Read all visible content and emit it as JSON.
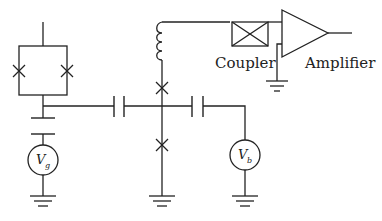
{
  "diagram": {
    "type": "circuit-schematic",
    "labels": {
      "coupler": "Coupler",
      "amplifier": "Amplifier"
    },
    "sources": {
      "gate_voltage": {
        "symbol": "V",
        "subscript": "g"
      },
      "bias_voltage": {
        "symbol": "V",
        "subscript": "b"
      }
    },
    "components": [
      "squid-loop-with-two-josephson-junctions",
      "gate-capacitor",
      "coupling-capacitor-left",
      "coupling-capacitor-right",
      "josephson-junction-upper",
      "josephson-junction-lower",
      "inductor",
      "directional-coupler",
      "amplifier",
      "ground-symbols"
    ],
    "colors": {
      "stroke": "#222222",
      "background": "#ffffff"
    }
  }
}
